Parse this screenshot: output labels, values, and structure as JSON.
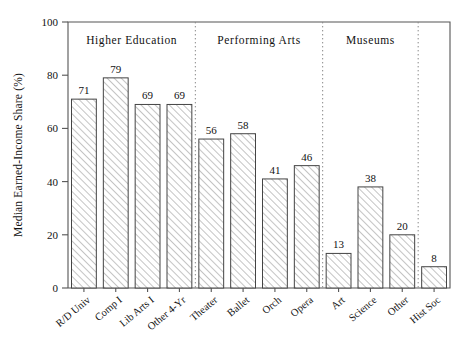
{
  "chart_data": {
    "type": "bar",
    "title": "",
    "xlabel": "",
    "ylabel": "Median Earned-Income Share (%)",
    "ylim": [
      0,
      100
    ],
    "yticks": [
      0,
      20,
      40,
      60,
      80,
      100
    ],
    "ytick_labels": [
      "0",
      "20",
      "40",
      "60",
      "80",
      "100"
    ],
    "grid": false,
    "legend": "none",
    "categories": [
      "R/D Univ",
      "Comp I",
      "Lib Arts I",
      "Other 4-Yr",
      "Theater",
      "Ballet",
      "Orch",
      "Opera",
      "Art",
      "Science",
      "Other",
      "Hist Soc"
    ],
    "values": [
      71,
      79,
      69,
      69,
      56,
      58,
      41,
      46,
      13,
      38,
      20,
      8
    ],
    "value_labels": [
      "71",
      "79",
      "69",
      "69",
      "56",
      "58",
      "41",
      "46",
      "13",
      "38",
      "20",
      "8"
    ],
    "groups": [
      {
        "label": "Higher Education",
        "members": [
          "R/D Univ",
          "Comp I",
          "Lib Arts I",
          "Other 4-Yr"
        ]
      },
      {
        "label": "Performing Arts",
        "members": [
          "Theater",
          "Ballet",
          "Orch",
          "Opera"
        ]
      },
      {
        "label": "Museums",
        "members": [
          "Art",
          "Science",
          "Other"
        ]
      },
      {
        "label": "",
        "members": [
          "Hist Soc"
        ]
      }
    ],
    "group_separators_after": [
      4,
      8,
      11
    ],
    "bar_style": {
      "fill": "hatched-diagonal",
      "fill_color": "#ffffff",
      "edge_color": "#444444"
    },
    "colors": {
      "axis": "#555555",
      "separator": "#888888",
      "text": "#111111",
      "background": "#ffffff"
    }
  }
}
